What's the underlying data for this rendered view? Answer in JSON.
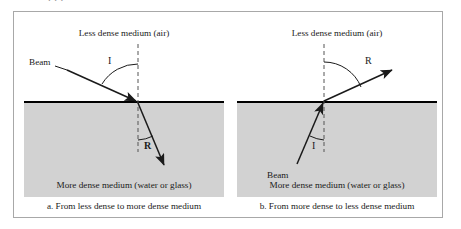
{
  "top_clipped_text": ". . .",
  "figure": {
    "panels": [
      {
        "id": "a",
        "top_medium_label": "Less dense medium (air)",
        "bottom_medium_label": "More dense medium (water or glass)",
        "caption": "a. From less dense to more dense medium",
        "beam_label": "Beam",
        "incident_angle_label": "I",
        "refracted_angle_label": "R"
      },
      {
        "id": "b",
        "top_medium_label": "Less dense medium (air)",
        "bottom_medium_label": "More dense medium (water or glass)",
        "caption": "b. From more dense to less dense medium",
        "beam_label": "Beam",
        "incident_angle_label": "I",
        "refracted_angle_label": "R"
      }
    ],
    "colors": {
      "dense_medium_fill": "#d2d2d2",
      "interface_line": "#000000",
      "ray_line": "#1a1a1a",
      "normal_dashed": "#555555",
      "frame_border": "#a8a8a8",
      "background": "#ffffff"
    }
  }
}
